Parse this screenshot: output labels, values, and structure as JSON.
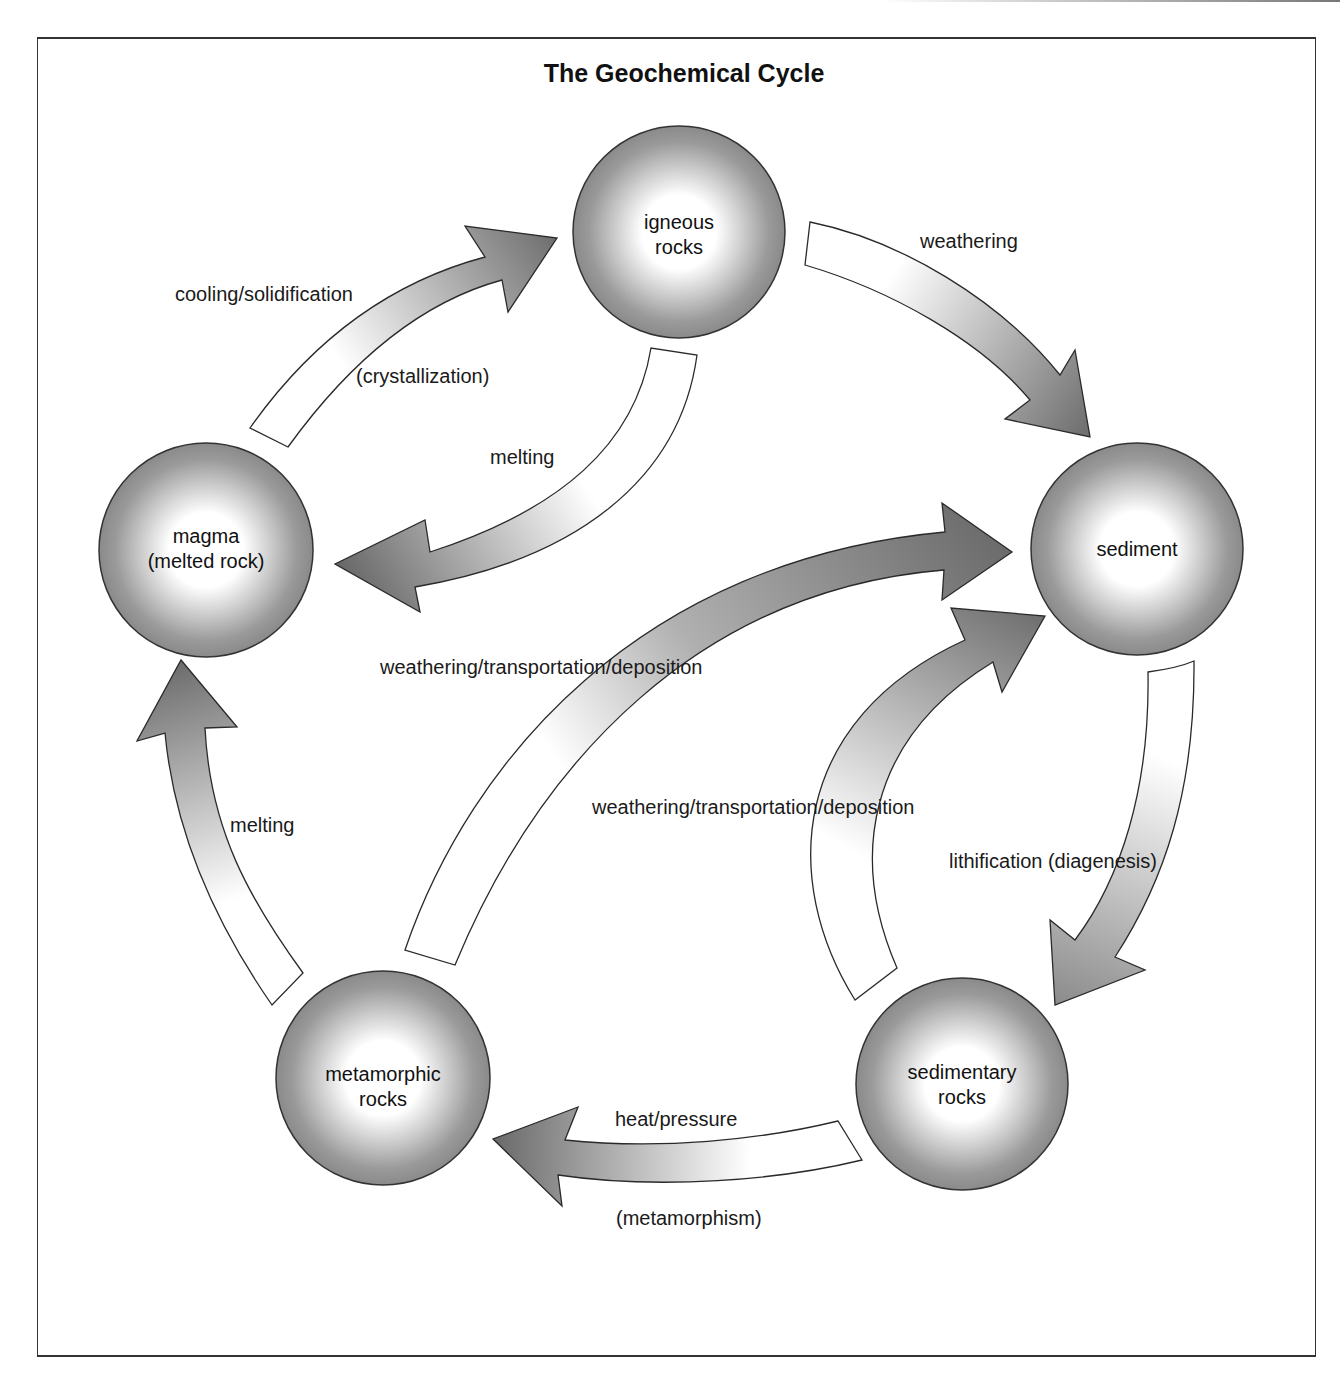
{
  "title": "The Geochemical Cycle",
  "nodes": {
    "igneous": {
      "line1": "igneous",
      "line2": "rocks"
    },
    "sediment": {
      "line1": "sediment"
    },
    "sedimentary": {
      "line1": "sedimentary",
      "line2": "rocks"
    },
    "metamorphic": {
      "line1": "metamorphic",
      "line2": "rocks"
    },
    "magma": {
      "line1": "magma",
      "line2": "(melted rock)"
    }
  },
  "processes": {
    "weathering": "weathering",
    "cooling": "cooling/solidification",
    "crystallization": "(crystallization)",
    "melting_igneous": "melting",
    "wtd_upper": "weathering/transportation/deposition",
    "wtd_lower": "weathering/transportation/deposition",
    "lithification": "lithification (diagenesis)",
    "heat_pressure": "heat/pressure",
    "metamorphism": "(metamorphism)",
    "melting_metamorphic": "melting"
  },
  "colors": {
    "arrow_dark": "#6e6e6e",
    "arrow_light": "#ffffff",
    "node_edge": "#8c8c8c",
    "node_center": "#ffffff",
    "stroke": "#2a2a2a"
  }
}
